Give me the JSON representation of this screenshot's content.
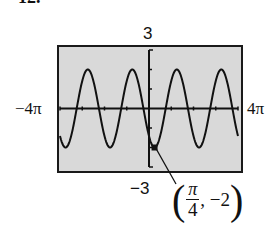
{
  "problem": {
    "number": "12."
  },
  "chart_data": {
    "type": "line",
    "title": "",
    "function_description": "Graphing-calculator plot of a sinusoid, y = -2cos(x - π/4)",
    "xlabel": "",
    "ylabel": "",
    "xlim": [
      "-4π",
      "4π"
    ],
    "ylim": [
      -3,
      3
    ],
    "xlim_numeric": [
      -12.566,
      12.566
    ],
    "x_tick_labels": {
      "left": "−4π",
      "right": "4π"
    },
    "y_tick_labels": {
      "top": "3",
      "bottom": "−3"
    },
    "amplitude": 2,
    "period": "2π",
    "peaks_count": 4,
    "troughs_count": 4,
    "series": [
      {
        "name": "y = -2cos(x - π/4)",
        "x": [
          -12.566,
          -11.781,
          -10.21,
          -8.639,
          -7.069,
          -5.498,
          -3.927,
          -2.356,
          -0.785,
          0.785,
          2.356,
          3.927,
          5.498,
          7.069,
          8.639,
          10.21,
          11.781,
          12.566
        ],
        "y": [
          -1.41,
          -2,
          0,
          2,
          0,
          -2,
          0,
          2,
          0,
          -2,
          0,
          2,
          0,
          -2,
          0,
          2,
          0,
          -1.41
        ]
      }
    ],
    "annotations": [
      {
        "point": [
          "π/4",
          -2
        ],
        "label": "(π/4, −2)"
      }
    ],
    "grid": false,
    "background": "#d9d9d9"
  },
  "labels": {
    "y_top": "3",
    "y_bottom": "−3",
    "x_left": "−4π",
    "x_right": "4π",
    "point": {
      "num": "π",
      "den": "4",
      "y": ", −2",
      "open": "(",
      "close": ")"
    }
  },
  "colors": {
    "screen": "#d9d9d9",
    "ink": "#111111",
    "border": "#1a1a1a"
  }
}
